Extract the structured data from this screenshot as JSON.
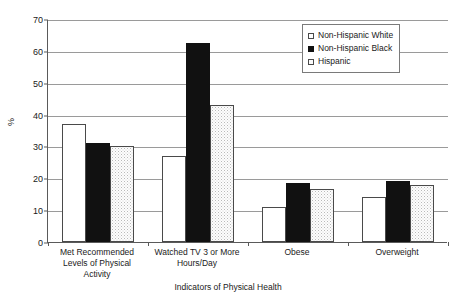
{
  "chart_data": {
    "type": "bar",
    "title": "",
    "xlabel": "Indicators of Physical Health",
    "ylabel": "%",
    "ylim": [
      0,
      70
    ],
    "ytick_step": 10,
    "yticks": [
      0,
      10,
      20,
      30,
      40,
      50,
      60,
      70
    ],
    "grid": true,
    "legend_position": "top-right",
    "categories": [
      "Met Recommended Levels of Physical Activity",
      "Watched TV 3 or More Hours/Day",
      "Obese",
      "Overweight"
    ],
    "category_lines": [
      [
        "Met Recommended",
        "Levels of Physical",
        "Activity"
      ],
      [
        "Watched TV 3 or More",
        "Hours/Day"
      ],
      [
        "Obese"
      ],
      [
        "Overweight"
      ]
    ],
    "series": [
      {
        "name": "Non-Hispanic White",
        "fill": "white",
        "values": [
          37,
          27,
          11,
          14
        ]
      },
      {
        "name": "Non-Hispanic Black",
        "fill": "black",
        "values": [
          31,
          62.5,
          18.5,
          19
        ]
      },
      {
        "name": "Hispanic",
        "fill": "dotted",
        "values": [
          30,
          43,
          16.5,
          18
        ]
      }
    ]
  },
  "colors": {
    "white_bar": "#ffffff",
    "black_bar": "#111111",
    "dotted_bar": "#fdfdfd",
    "gridline": "#9a9a9a",
    "axis": "#5a5a5a",
    "text": "#1a1a1a",
    "background": "#ffffff"
  }
}
